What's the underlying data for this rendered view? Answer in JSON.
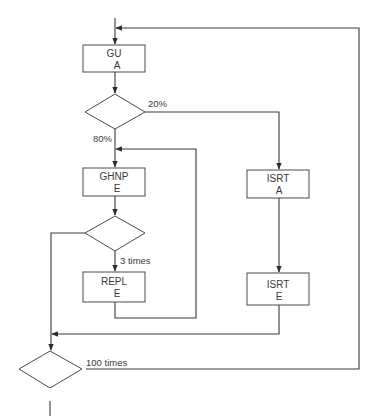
{
  "diagram": {
    "type": "flowchart",
    "nodes": [
      {
        "id": "gu_a",
        "shape": "process",
        "line1": "GU",
        "line2": "A"
      },
      {
        "id": "decision_1",
        "shape": "decision"
      },
      {
        "id": "ghnp_e",
        "shape": "process",
        "line1": "GHNP",
        "line2": "E"
      },
      {
        "id": "decision_2",
        "shape": "decision"
      },
      {
        "id": "repl_e",
        "shape": "process",
        "line1": "REPL",
        "line2": "E"
      },
      {
        "id": "isrt_a",
        "shape": "process",
        "line1": "ISRT",
        "line2": "A"
      },
      {
        "id": "isrt_e",
        "shape": "process",
        "line1": "ISRT",
        "line2": "E"
      },
      {
        "id": "decision_3",
        "shape": "decision"
      }
    ],
    "edge_labels": {
      "pct_20": "20%",
      "pct_80": "80%",
      "three_times": "3 times",
      "hundred_times": "100 times"
    },
    "edges": [
      {
        "from": "entry",
        "to": "gu_a"
      },
      {
        "from": "gu_a",
        "to": "decision_1"
      },
      {
        "from": "decision_1",
        "to": "isrt_a",
        "label": "20%"
      },
      {
        "from": "decision_1",
        "to": "ghnp_e",
        "label": "80%"
      },
      {
        "from": "ghnp_e",
        "to": "decision_2"
      },
      {
        "from": "decision_2",
        "to": "repl_e",
        "label": "3 times"
      },
      {
        "from": "repl_e",
        "to": "ghnp_e"
      },
      {
        "from": "decision_2",
        "to": "decision_3"
      },
      {
        "from": "isrt_a",
        "to": "isrt_e"
      },
      {
        "from": "isrt_e",
        "to": "decision_3"
      },
      {
        "from": "decision_3",
        "to": "gu_a",
        "label": "100 times"
      },
      {
        "from": "decision_3",
        "to": "exit"
      }
    ]
  }
}
